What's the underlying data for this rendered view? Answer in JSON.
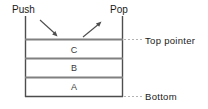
{
  "diagram": {
    "labels": {
      "push": "Push",
      "pop": "Pop",
      "top_pointer": "Top pointer",
      "bottom": "Bottom"
    },
    "stack_cells": [
      {
        "label": "C"
      },
      {
        "label": "B"
      },
      {
        "label": "A"
      }
    ],
    "colors": {
      "stroke": "#4d4d4d",
      "cell_divider": "#808080",
      "text": "#1a1a1a",
      "leader": "#b3b3b3",
      "background": "#ffffff"
    }
  }
}
